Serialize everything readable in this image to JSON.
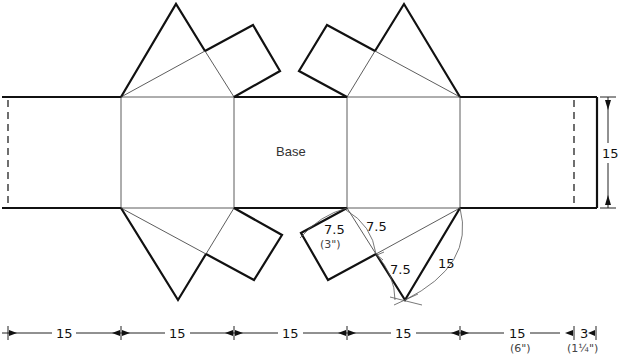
{
  "diagram": {
    "type": "pattern-net",
    "center_label": "Base",
    "bottom_dimensions": [
      {
        "value": "15",
        "sub": ""
      },
      {
        "value": "15",
        "sub": ""
      },
      {
        "value": "15",
        "sub": ""
      },
      {
        "value": "15",
        "sub": ""
      },
      {
        "value": "15",
        "sub": "(6\")"
      },
      {
        "value": "3",
        "sub": "(1¼\")"
      }
    ],
    "right_dimension": {
      "value": "15"
    },
    "construction_labels": {
      "square_side": "7.5",
      "square_side_inches": "(3\")",
      "half_segment_upper": "7.5",
      "half_segment_lower": "7.5",
      "triangle_side": "15"
    },
    "colors": {
      "line": "#111111",
      "background": "#ffffff"
    }
  }
}
